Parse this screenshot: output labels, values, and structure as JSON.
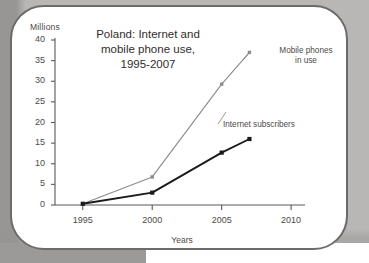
{
  "figure": {
    "unit_label": "Millions",
    "title_lines": [
      "Poland: Internet and",
      "mobile phone use,",
      "1995-2007"
    ],
    "x_axis_title": "Years",
    "series_label_mobile_line1": "Mobile phones",
    "series_label_mobile_line2": "in use",
    "series_label_internet": "Internet subscribers",
    "frame_color": "#6d6b6a",
    "axis_color": "#5a5857",
    "mobile_color": "#8d8b8a",
    "internet_color": "#1a1a1a",
    "text_color": "#4c4a49"
  },
  "chart_data": {
    "type": "line",
    "title": "Poland: Internet and mobile phone use, 1995-2007",
    "xlabel": "Years",
    "ylabel": "Millions",
    "xlim": [
      1993,
      2011
    ],
    "ylim": [
      0,
      40
    ],
    "xticks": [
      1995,
      2000,
      2005,
      2010
    ],
    "yticks": [
      0,
      5,
      10,
      15,
      20,
      25,
      30,
      35,
      40
    ],
    "grid": false,
    "legend": "inline-annotations",
    "series": [
      {
        "name": "Mobile phones in use",
        "color": "#8d8b8a",
        "marker": "square",
        "x": [
          1995,
          2000,
          2005,
          2007
        ],
        "values": [
          0.3,
          6.8,
          29.3,
          37.0
        ]
      },
      {
        "name": "Internet subscribers",
        "color": "#1a1a1a",
        "marker": "square",
        "x": [
          1995,
          2000,
          2005,
          2007
        ],
        "values": [
          0.3,
          3.0,
          12.7,
          16.0
        ]
      }
    ]
  }
}
